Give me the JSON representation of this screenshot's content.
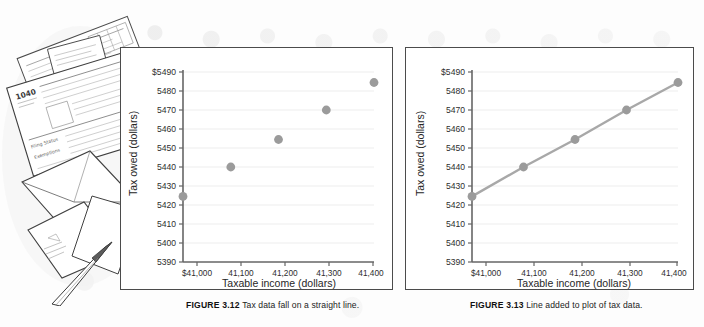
{
  "illustration": {
    "name": "tax-forms-envelopes-pen-illustration",
    "form_label": "1040",
    "description": "Line drawing of stacked tax forms, envelopes and a pen"
  },
  "figures": [
    {
      "id": "figure-3-12",
      "caption_lead": "FIGURE 3.12",
      "caption_body": "Tax data fall on a straight line."
    },
    {
      "id": "figure-3-13",
      "caption_lead": "FIGURE 3.13",
      "caption_body": "Line added to plot of tax data."
    }
  ],
  "colors": {
    "marker": "#9b9b9b",
    "line": "#a8a8a8",
    "gridline": "#ececec",
    "axis": "#6f6f6f",
    "panel_border": "#4b4b4b",
    "text": "#2a2a2a"
  },
  "chart_data": [
    {
      "type": "scatter",
      "title": "",
      "xlabel": "Taxable income (dollars)",
      "ylabel": "Tax owed (dollars)",
      "x": [
        41000,
        41100,
        41200,
        41300,
        41400
      ],
      "y": [
        5424.5,
        5440.0,
        5454.5,
        5470.0,
        5484.5
      ],
      "xticks": [
        41000,
        41100,
        41200,
        41300,
        41400
      ],
      "xticklabels": [
        "$41,000",
        "41,100",
        "41,200",
        "41,300",
        "41,400"
      ],
      "yticks": [
        5390,
        5400,
        5410,
        5420,
        5430,
        5440,
        5450,
        5460,
        5470,
        5480,
        5490
      ],
      "yticklabels": [
        "5390",
        "5400",
        "5410",
        "5420",
        "5430",
        "5440",
        "5450",
        "5460",
        "5470",
        "5480",
        "$5490"
      ],
      "xlim": [
        40960,
        41440
      ],
      "ylim": [
        5390,
        5490
      ],
      "grid": true,
      "grid_axis": "y",
      "legend": false,
      "has_line": false
    },
    {
      "type": "line",
      "title": "",
      "xlabel": "Taxable income (dollars)",
      "ylabel": "Tax owed (dollars)",
      "x": [
        41000,
        41100,
        41200,
        41300,
        41400
      ],
      "y": [
        5424.5,
        5440.0,
        5454.5,
        5470.0,
        5484.5
      ],
      "xticks": [
        41000,
        41100,
        41200,
        41300,
        41400
      ],
      "xticklabels": [
        "$41,000",
        "41,100",
        "41,200",
        "41,300",
        "41,400"
      ],
      "yticks": [
        5390,
        5400,
        5410,
        5420,
        5430,
        5440,
        5450,
        5460,
        5470,
        5480,
        5490
      ],
      "yticklabels": [
        "5390",
        "5400",
        "5410",
        "5420",
        "5430",
        "5440",
        "5450",
        "5460",
        "5470",
        "5480",
        "$5490"
      ],
      "xlim": [
        40960,
        41440
      ],
      "ylim": [
        5390,
        5490
      ],
      "grid": true,
      "grid_axis": "y",
      "legend": false,
      "has_line": true
    }
  ]
}
